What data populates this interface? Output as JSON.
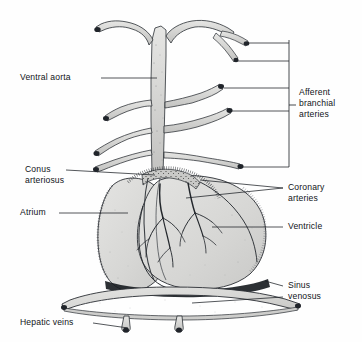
{
  "figure": {
    "background_color": "#fefefe",
    "ink_color": "#111418",
    "tissue_fill": "#d8d8d6",
    "tissue_fill_light": "#e2e2e0",
    "tissue_fill_dark": "#c6c6c4",
    "leader_color": "#1b1f24"
  },
  "labels": {
    "ventral_aorta": "Ventral aorta",
    "conus_arteriosus_line1": "Conus",
    "conus_arteriosus_line2": "arteriosus",
    "atrium": "Atrium",
    "hepatic_veins": "Hepatic veins",
    "afferent_line1": "Afferent",
    "afferent_line2": "branchial",
    "afferent_line3": "arteries",
    "coronary_line1": "Coronary",
    "coronary_line2": "arteries",
    "ventricle": "Ventricle",
    "sinus_line1": "Sinus",
    "sinus_line2": "venosus"
  },
  "caption": {
    "text": ""
  },
  "structures": [
    {
      "name": "ventral-aorta",
      "label": "Ventral aorta"
    },
    {
      "name": "afferent-branchial-arteries",
      "label": "Afferent branchial arteries",
      "pairs": 4
    },
    {
      "name": "conus-arteriosus",
      "label": "Conus arteriosus"
    },
    {
      "name": "coronary-arteries",
      "label": "Coronary arteries"
    },
    {
      "name": "atrium",
      "label": "Atrium"
    },
    {
      "name": "ventricle",
      "label": "Ventricle"
    },
    {
      "name": "sinus-venosus",
      "label": "Sinus venosus"
    },
    {
      "name": "hepatic-veins",
      "label": "Hepatic veins",
      "count": 2
    }
  ]
}
